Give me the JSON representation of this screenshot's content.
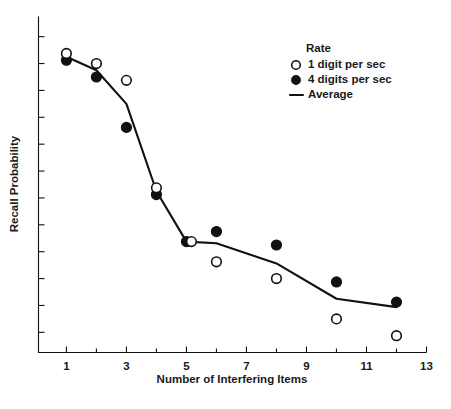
{
  "chart_data": {
    "type": "scatter",
    "title": "",
    "xlabel": "Number of Interfering Items",
    "ylabel": "Recall Probability",
    "xlim": [
      0.07,
      13.0
    ],
    "ylim": [
      0.0,
      1.0
    ],
    "grid": false,
    "x_ticks_major": [
      1,
      3,
      5,
      7,
      9,
      11,
      13
    ],
    "x_ticks_minor": [
      2,
      4,
      6,
      8,
      10,
      12
    ],
    "x_tick_labels": [
      "1",
      "3",
      "5",
      "7",
      "9",
      "11",
      "13"
    ],
    "y_ticks": [
      0.06,
      0.14,
      0.22,
      0.3,
      0.38,
      0.46,
      0.54,
      0.62,
      0.7,
      0.78,
      0.86,
      0.94
    ],
    "y_tick_labels": [],
    "legend": {
      "title": "Rate",
      "position": "top-right",
      "entries": [
        {
          "label": "1 digit per sec",
          "marker": "open-circle"
        },
        {
          "label": "4 digits per sec",
          "marker": "filled-circle"
        },
        {
          "label": "Average",
          "marker": "line"
        }
      ]
    },
    "series": [
      {
        "name": "1 digit per sec",
        "marker": "open-circle",
        "x": [
          1,
          2,
          3,
          4,
          5,
          6,
          8,
          10,
          12
        ],
        "values": [
          0.89,
          0.86,
          0.81,
          0.49,
          0.33,
          0.27,
          0.22,
          0.1,
          0.05
        ]
      },
      {
        "name": "4 digits per sec",
        "marker": "filled-circle",
        "x": [
          1,
          2,
          3,
          4,
          5,
          6,
          8,
          10,
          12
        ],
        "values": [
          0.87,
          0.82,
          0.67,
          0.47,
          0.33,
          0.36,
          0.32,
          0.21,
          0.15
        ]
      },
      {
        "name": "Average",
        "marker": "line",
        "x": [
          1,
          2,
          3,
          4,
          5,
          6,
          8,
          10,
          12
        ],
        "values": [
          0.88,
          0.84,
          0.74,
          0.48,
          0.33,
          0.325,
          0.265,
          0.16,
          0.135
        ]
      }
    ],
    "colors": {
      "foreground": "#111111",
      "background": "#ffffff",
      "marker_open_fill": "#ffffff",
      "marker_filled_fill": "#111111"
    }
  }
}
